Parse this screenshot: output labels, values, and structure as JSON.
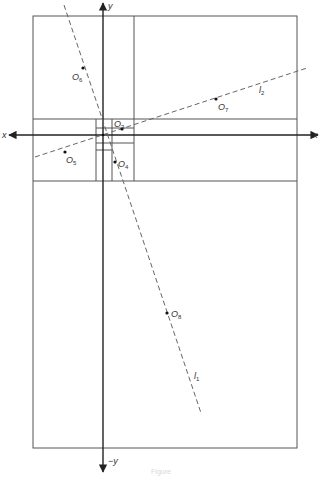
{
  "diagram": {
    "axes": {
      "x_positive_label": "x",
      "x_negative_label": "x",
      "y_positive_label": "y",
      "y_negative_label": "−y"
    },
    "lines": [
      {
        "id": "l1",
        "label": "l",
        "subscript": "1",
        "style": "dashed"
      },
      {
        "id": "l2",
        "label": "l",
        "subscript": "2",
        "style": "dashed"
      }
    ],
    "points": [
      {
        "id": "O3",
        "label": "O",
        "subscript": "3"
      },
      {
        "id": "O4",
        "label": "O",
        "subscript": "4"
      },
      {
        "id": "O5",
        "label": "O",
        "subscript": "5"
      },
      {
        "id": "O6",
        "label": "O",
        "subscript": "6"
      },
      {
        "id": "O7",
        "label": "O",
        "subscript": "7"
      },
      {
        "id": "O8",
        "label": "O",
        "subscript": "8"
      }
    ],
    "colors": {
      "stroke": "#555555",
      "axis": "#222222",
      "dashed": "#666666",
      "text": "#333333"
    },
    "caption": "Figure"
  }
}
